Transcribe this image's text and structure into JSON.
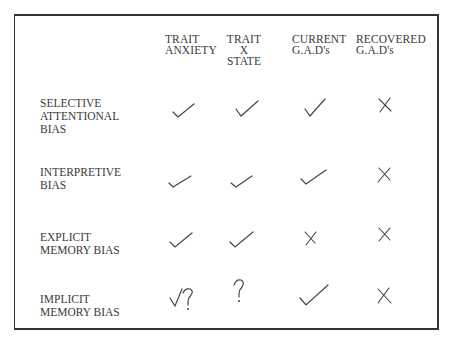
{
  "table": {
    "columns": [
      {
        "lines": [
          "TRAIT",
          "ANXIETY"
        ]
      },
      {
        "lines": [
          "TRAIT",
          "X",
          "STATE"
        ]
      },
      {
        "lines": [
          "CURRENT",
          "G.A.D's"
        ]
      },
      {
        "lines": [
          "RECOVERED",
          "G.A.D's"
        ]
      }
    ],
    "rows": [
      {
        "label_lines": [
          "SELECTIVE",
          "ATTENTIONAL",
          "BIAS"
        ],
        "cells": [
          "check",
          "check",
          "check",
          "cross"
        ]
      },
      {
        "label_lines": [
          "INTERPRETIVE",
          "BIAS"
        ],
        "cells": [
          "check",
          "check",
          "check",
          "cross"
        ]
      },
      {
        "label_lines": [
          "EXPLICIT",
          "MEMORY BIAS"
        ],
        "cells": [
          "check",
          "check",
          "cross",
          "cross"
        ]
      },
      {
        "label_lines": [
          "IMPLICIT",
          "MEMORY BIAS"
        ],
        "cells": [
          "check-question",
          "question",
          "check",
          "cross"
        ]
      }
    ]
  },
  "colors": {
    "ink": "#3a3a3a",
    "border": "#333333"
  }
}
